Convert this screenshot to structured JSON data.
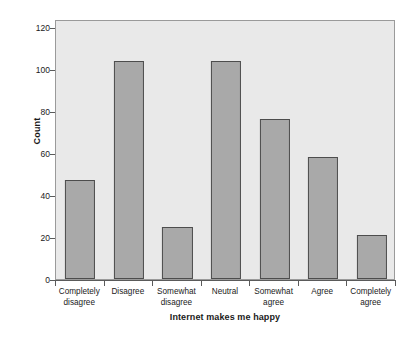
{
  "chart_data": {
    "type": "bar",
    "title": "",
    "xlabel": "Internet makes me happy",
    "ylabel": "Count",
    "categories": [
      "Completely disagree",
      "Disagree",
      "Somewhat disagree",
      "Neutral",
      "Somewhat agree",
      "Agree",
      "Completely agree"
    ],
    "category_lines": [
      [
        "Completely",
        "disagree"
      ],
      [
        "Disagree",
        ""
      ],
      [
        "Somewhat",
        "disagree"
      ],
      [
        "Neutral",
        ""
      ],
      [
        "Somewhat",
        "agree"
      ],
      [
        "Agree",
        ""
      ],
      [
        "Completely",
        "agree"
      ]
    ],
    "values": [
      47,
      104,
      25,
      104,
      76,
      58,
      21
    ],
    "ylim": [
      0,
      120
    ],
    "yticks": [
      0,
      20,
      40,
      60,
      80,
      100,
      120
    ],
    "ytick_labels": [
      "0",
      "20",
      "40",
      "60",
      "80",
      "100",
      "120"
    ],
    "grid": false,
    "legend": null,
    "colors": {
      "bar_fill": "#a9a9a9",
      "bar_border": "#4d4d4d",
      "plot_background": "#e9e9e9",
      "plot_border": "#9a9a9a",
      "page_background": "#ffffff",
      "text": "#1a1a1a",
      "axis_line": "#5a5a5a"
    }
  }
}
